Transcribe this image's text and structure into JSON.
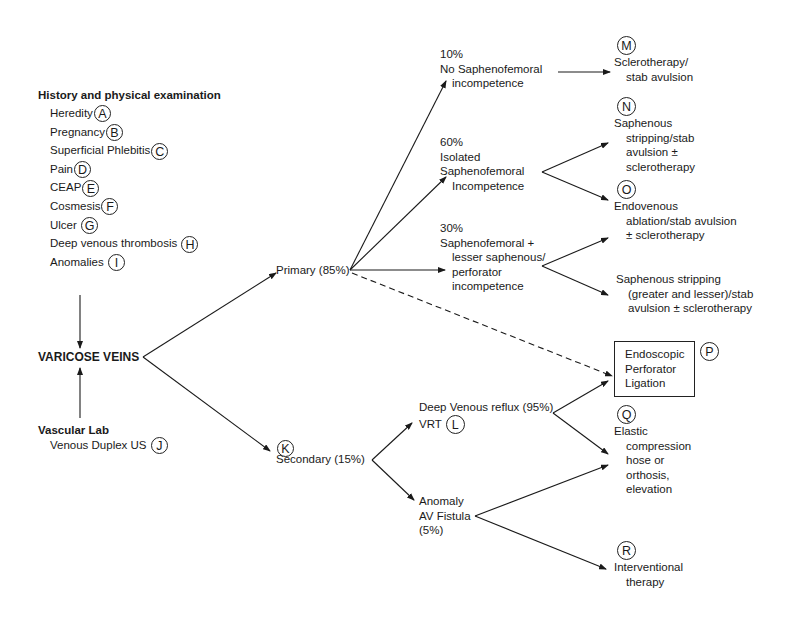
{
  "history": {
    "heading": "History and physical examination",
    "items": [
      {
        "label": "Heredity",
        "marker": "A"
      },
      {
        "label": "Pregnancy",
        "marker": "B"
      },
      {
        "label": "Superficial Phlebitis",
        "marker": "C"
      },
      {
        "label": "Pain",
        "marker": "D"
      },
      {
        "label": "CEAP",
        "marker": "E"
      },
      {
        "label": "Cosmesis",
        "marker": "F"
      },
      {
        "label": "Ulcer",
        "marker": "G"
      },
      {
        "label": "Deep venous thrombosis",
        "marker": "H"
      },
      {
        "label": "Anomalies",
        "marker": "I"
      }
    ]
  },
  "root": {
    "label": "VARICOSE VEINS"
  },
  "vascular_lab": {
    "heading": "Vascular Lab",
    "item": {
      "label": "Venous Duplex US",
      "marker": "J"
    }
  },
  "primary": {
    "label": "Primary (85%)"
  },
  "secondary": {
    "label": "Secondary (15%)",
    "marker": "K"
  },
  "primary_branches": [
    {
      "pct": "10%",
      "lines": [
        "No Saphenofemoral",
        "incompetence"
      ]
    },
    {
      "pct": "60%",
      "lines": [
        "Isolated",
        "Saphenofemoral",
        "Incompetence"
      ]
    },
    {
      "pct": "30%",
      "lines": [
        "Saphenofemoral +",
        "lesser saphenous/",
        "perforator",
        "incompetence"
      ]
    }
  ],
  "treatments": {
    "M": {
      "marker": "M",
      "lines": [
        "Sclerotherapy/",
        "stab avulsion"
      ]
    },
    "N": {
      "marker": "N",
      "lines": [
        "Saphenous",
        "stripping/stab",
        "avulsion ±",
        "sclerotherapy"
      ]
    },
    "O": {
      "marker": "O",
      "lines": [
        "Endovenous",
        "ablation/stab avulsion",
        "± sclerotherapy"
      ]
    },
    "S": {
      "lines": [
        "Saphenous stripping",
        "(greater and lesser)/stab",
        "avulsion ± sclerotherapy"
      ]
    },
    "P": {
      "marker": "P",
      "lines": [
        "Endoscopic",
        "Perforator",
        "Ligation"
      ]
    },
    "Q": {
      "marker": "Q",
      "lines": [
        "Elastic",
        "compression",
        "hose or",
        "orthosis,",
        "elevation"
      ]
    },
    "R": {
      "marker": "R",
      "lines": [
        "Interventional",
        "therapy"
      ]
    }
  },
  "deep_reflux": {
    "label": "Deep Venous reflux (95%)",
    "sub": "VRT",
    "marker": "L"
  },
  "anomaly": {
    "lines": [
      "Anomaly",
      "AV Fistula",
      "(5%)"
    ]
  },
  "colors": {
    "ink": "#1a1a1a",
    "background": "#ffffff"
  }
}
